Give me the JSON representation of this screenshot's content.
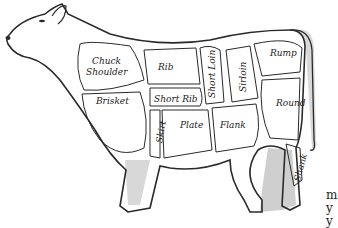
{
  "diagram": {
    "cuts": [
      {
        "id": "chuck",
        "line1": "Chuck",
        "line2": "Shoulder"
      },
      {
        "id": "rib",
        "label": "Rib"
      },
      {
        "id": "short-loin",
        "label": "Short Loin"
      },
      {
        "id": "sirloin",
        "label": "Sirloin"
      },
      {
        "id": "rump",
        "label": "Rump"
      },
      {
        "id": "round",
        "label": "Round"
      },
      {
        "id": "brisket",
        "label": "Brisket"
      },
      {
        "id": "short-rib",
        "label": "Short Rib"
      },
      {
        "id": "skirt",
        "label": "Skirt"
      },
      {
        "id": "plate",
        "label": "Plate"
      },
      {
        "id": "flank",
        "label": "Flank"
      },
      {
        "id": "shank",
        "label": "Shank"
      }
    ],
    "text_fragments": [
      "m",
      "y",
      "y"
    ]
  },
  "colors": {
    "outline": "#2a2a2a",
    "shade": "#c8c8c8",
    "background": "#ffffff"
  }
}
